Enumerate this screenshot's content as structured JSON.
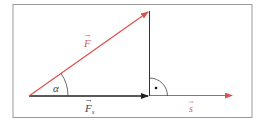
{
  "diagram": {
    "labels": {
      "force": "F",
      "force_component": "F",
      "force_component_subscript": "s",
      "displacement": "s",
      "angle": "α",
      "right_angle_marker": "·"
    },
    "colors": {
      "force_vector": "#d9534f",
      "displacement_vector": "#d9534f",
      "component_vector": "#222222",
      "lines": "#333333",
      "frame": "#999999",
      "label_red": "#d06060",
      "label_dark": "#444444"
    }
  }
}
